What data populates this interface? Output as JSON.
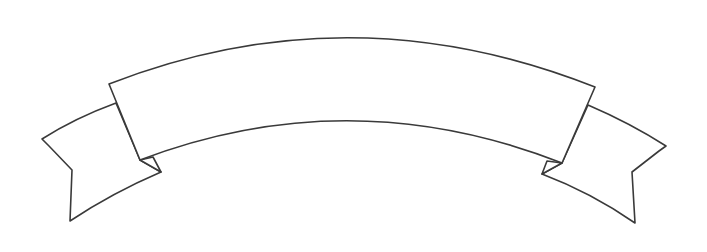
{
  "illustration": {
    "type": "blank-ribbon-banner",
    "label": "",
    "colors": {
      "background": "#ffffff",
      "outline": "#3a3a3a",
      "fill": "#ffffff"
    }
  }
}
